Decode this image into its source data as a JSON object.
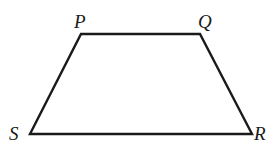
{
  "diagram": {
    "type": "trapezoid",
    "stroke_color": "#1a1a1a",
    "background": "#ffffff",
    "vertices": [
      {
        "label": "P",
        "x": 81,
        "y": 34,
        "label_x": 74,
        "label_y": 12
      },
      {
        "label": "Q",
        "x": 200,
        "y": 34,
        "label_x": 198,
        "label_y": 12
      },
      {
        "label": "R",
        "x": 252,
        "y": 134,
        "label_x": 254,
        "label_y": 124
      },
      {
        "label": "S",
        "x": 30,
        "y": 134,
        "label_x": 9,
        "label_y": 124
      }
    ],
    "edges": [
      {
        "from": "P",
        "to": "Q"
      },
      {
        "from": "Q",
        "to": "R"
      },
      {
        "from": "R",
        "to": "S"
      },
      {
        "from": "S",
        "to": "P"
      }
    ]
  }
}
